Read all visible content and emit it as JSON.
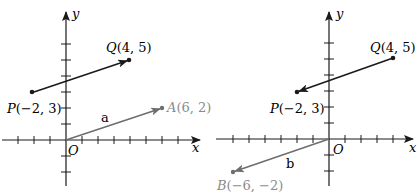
{
  "colors": {
    "axis": "#1a1a1a",
    "pq_vector": "#1a1a1a",
    "position_vector": "#6e6e6e",
    "gray_label": "#8a8a8a"
  },
  "left_panel": {
    "x_axis_label": "x",
    "y_axis_label": "y",
    "origin_label": "O",
    "P_label": "P(−2, 3)",
    "Q_label": "Q(4, 5)",
    "A_label": "A(6, 2)",
    "vector_label": "a",
    "vector_PQ": {
      "from": [
        -2,
        3
      ],
      "to": [
        4,
        5
      ]
    },
    "vector_OA": {
      "from": [
        0,
        0
      ],
      "to": [
        6,
        2
      ]
    }
  },
  "right_panel": {
    "x_axis_label": "x",
    "y_axis_label": "y",
    "origin_label": "O",
    "P_label": "P(−2, 3)",
    "Q_label": "Q(4, 5)",
    "B_label": "B(−6, −2)",
    "vector_label": "b",
    "vector_QP": {
      "from": [
        4,
        5
      ],
      "to": [
        -2,
        3
      ]
    },
    "vector_OB": {
      "from": [
        0,
        0
      ],
      "to": [
        -6,
        -2
      ]
    }
  }
}
